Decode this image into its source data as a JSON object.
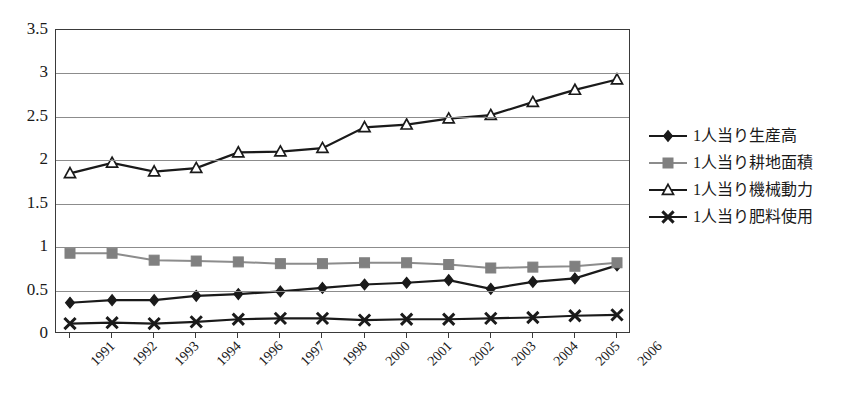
{
  "chart_data": {
    "type": "line",
    "title": "",
    "xlabel": "",
    "ylabel": "",
    "ylim": [
      0,
      3.5
    ],
    "ytick_step": 0.5,
    "grid": true,
    "legend_position": "right",
    "categories": [
      "1991",
      "1992",
      "1993",
      "1994",
      "1996",
      "1997",
      "1998",
      "2000",
      "2001",
      "2002",
      "2003",
      "2004",
      "2005",
      "2006"
    ],
    "yticks": [
      "0",
      "0.5",
      "1",
      "1.5",
      "2",
      "2.5",
      "3",
      "3.5"
    ],
    "ytick_values": [
      0,
      0.5,
      1,
      1.5,
      2,
      2.5,
      3,
      3.5
    ],
    "series": [
      {
        "name": "1人当り生産高",
        "marker": "diamond",
        "marker_fill": "#1a1a1a",
        "line_color": "#1a1a1a",
        "values": [
          0.36,
          0.39,
          0.39,
          0.44,
          0.46,
          0.49,
          0.53,
          0.57,
          0.59,
          0.62,
          0.52,
          0.6,
          0.64,
          0.79
        ]
      },
      {
        "name": "1人当り耕地面積",
        "marker": "square",
        "marker_fill": "#808080",
        "line_color": "#8c8c8c",
        "values": [
          0.93,
          0.93,
          0.85,
          0.84,
          0.83,
          0.81,
          0.81,
          0.82,
          0.82,
          0.8,
          0.76,
          0.77,
          0.78,
          0.82
        ]
      },
      {
        "name": "1人当り機械動力",
        "marker": "triangle",
        "marker_fill": "#ffffff",
        "line_color": "#1a1a1a",
        "values": [
          1.85,
          1.97,
          1.87,
          1.91,
          2.09,
          2.1,
          2.14,
          2.38,
          2.41,
          2.48,
          2.52,
          2.67,
          2.81,
          2.93
        ]
      },
      {
        "name": "1人当り肥料使用",
        "marker": "cross",
        "marker_fill": "#1a1a1a",
        "line_color": "#1a1a1a",
        "values": [
          0.12,
          0.13,
          0.12,
          0.14,
          0.17,
          0.18,
          0.18,
          0.16,
          0.17,
          0.17,
          0.18,
          0.19,
          0.21,
          0.22
        ]
      }
    ]
  },
  "legend": {
    "items": [
      {
        "label": "1人当り生産高"
      },
      {
        "label": "1人当り耕地面積"
      },
      {
        "label": "1人当り機械動力"
      },
      {
        "label": "1人当り肥料使用"
      }
    ]
  }
}
